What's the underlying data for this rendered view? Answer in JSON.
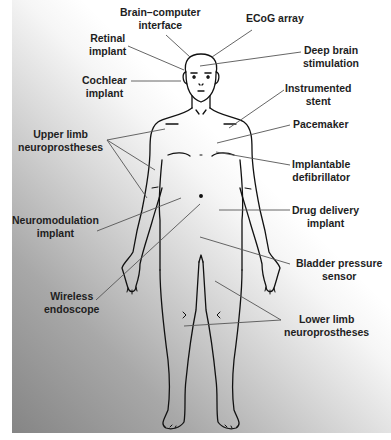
{
  "diagram": {
    "labels": [
      {
        "id": "brain-computer-interface",
        "lines": [
          "Brain–computer",
          "interface"
        ]
      },
      {
        "id": "ecog-array",
        "lines": [
          "ECoG array"
        ]
      },
      {
        "id": "retinal-implant",
        "lines": [
          "Retinal",
          "implant"
        ]
      },
      {
        "id": "deep-brain-stimulation",
        "lines": [
          "Deep brain",
          "stimulation"
        ]
      },
      {
        "id": "cochlear-implant",
        "lines": [
          "Cochlear",
          "implant"
        ]
      },
      {
        "id": "instrumented-stent",
        "lines": [
          "Instrumented",
          "stent"
        ]
      },
      {
        "id": "upper-limb-neuroprostheses",
        "lines": [
          "Upper limb",
          "neuroprostheses"
        ]
      },
      {
        "id": "pacemaker",
        "lines": [
          "Pacemaker"
        ]
      },
      {
        "id": "implantable-defibrillator",
        "lines": [
          "Implantable",
          "defibrillator"
        ]
      },
      {
        "id": "neuromodulation-implant",
        "lines": [
          "Neuromodulation",
          "implant"
        ]
      },
      {
        "id": "drug-delivery-implant",
        "lines": [
          "Drug delivery",
          "implant"
        ]
      },
      {
        "id": "bladder-pressure-sensor",
        "lines": [
          "Bladder pressure",
          "sensor"
        ]
      },
      {
        "id": "wireless-endoscope",
        "lines": [
          "Wireless",
          "endoscope"
        ]
      },
      {
        "id": "lower-limb-neuroprostheses",
        "lines": [
          "Lower limb",
          "neuroprostheses"
        ]
      }
    ],
    "colors": {
      "text": "#1e1e1e",
      "outline": "#111111",
      "leader_line": "#555555",
      "gradient_dark": "#858585",
      "gradient_light": "#ffffff"
    }
  }
}
